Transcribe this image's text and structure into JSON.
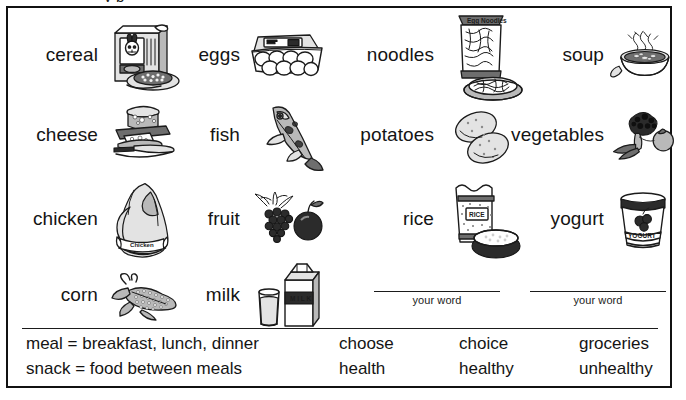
{
  "page": {
    "clipped_title_fragment": "  y     p  ",
    "type": "vocabulary worksheet"
  },
  "grid": {
    "items": [
      {
        "word": "cereal",
        "icon": "cereal-box-icon",
        "col": 0,
        "row": 0
      },
      {
        "word": "eggs",
        "icon": "egg-carton-icon",
        "col": 1,
        "row": 0
      },
      {
        "word": "noodles",
        "icon": "noodle-bag-icon",
        "col": 2,
        "row": 0
      },
      {
        "word": "soup",
        "icon": "soup-bowl-icon",
        "col": 3,
        "row": 0
      },
      {
        "word": "cheese",
        "icon": "cheese-board-icon",
        "col": 0,
        "row": 1
      },
      {
        "word": "fish",
        "icon": "fish-icon",
        "col": 1,
        "row": 1
      },
      {
        "word": "potatoes",
        "icon": "potatoes-icon",
        "col": 2,
        "row": 1
      },
      {
        "word": "vegetables",
        "icon": "broccoli-icon",
        "col": 3,
        "row": 1
      },
      {
        "word": "chicken",
        "icon": "whole-chicken-icon",
        "col": 0,
        "row": 2
      },
      {
        "word": "fruit",
        "icon": "grapes-apple-icon",
        "col": 1,
        "row": 2
      },
      {
        "word": "rice",
        "icon": "rice-bag-bowl-icon",
        "col": 2,
        "row": 2
      },
      {
        "word": "yogurt",
        "icon": "yogurt-cup-icon",
        "col": 3,
        "row": 2
      },
      {
        "word": "corn",
        "icon": "corn-cob-icon",
        "col": 0,
        "row": 3
      },
      {
        "word": "milk",
        "icon": "milk-carton-icon",
        "col": 1,
        "row": 3
      }
    ],
    "blanks": [
      {
        "caption": "your word",
        "col": 2
      },
      {
        "caption": "your word",
        "col": 3
      }
    ]
  },
  "vocabulary": {
    "rows": [
      {
        "definition": "meal = breakfast, lunch, dinner",
        "word1": "choose",
        "word2": "choice",
        "word3": "groceries"
      },
      {
        "definition": "snack = food between meals",
        "word1": "health",
        "word2": "healthy",
        "word3": "unhealthy"
      }
    ]
  },
  "style": {
    "ink": "#1b1b1b",
    "paper": "#ffffff"
  }
}
